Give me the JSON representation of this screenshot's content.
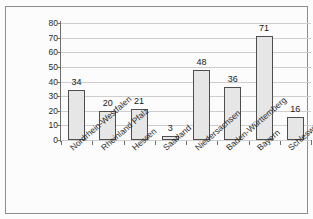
{
  "scan_artifact_text": "",
  "chart_data": {
    "type": "bar",
    "title": "",
    "xlabel": "",
    "ylabel": "",
    "ylim": [
      0,
      80
    ],
    "ytick_step": 10,
    "ytick_labels": [
      "80",
      "70",
      "60",
      "50",
      "40",
      "30",
      "20",
      "10",
      "0"
    ],
    "grid": true,
    "legend": "none",
    "bar_fill_color": "#e8e8e8",
    "bar_border_color": "#4a4a4a",
    "gridline_color": "#cfcfcf",
    "axis_color": "#6a6a6a",
    "frame_color": "#8d8d8d",
    "background_color": "#ffffff",
    "categories": [
      "Nordrhein-Westfalen",
      "Rheinland Pfalz",
      "Hessen",
      "Saarland",
      "Niedersachsen",
      "Baden-Württemberg",
      "Bayern",
      "Schleswig Holstein"
    ],
    "values": [
      34,
      20,
      21,
      3,
      48,
      36,
      71,
      16
    ],
    "value_labels": [
      "34",
      "20",
      "21",
      "3",
      "48",
      "36",
      "71",
      "16"
    ]
  }
}
